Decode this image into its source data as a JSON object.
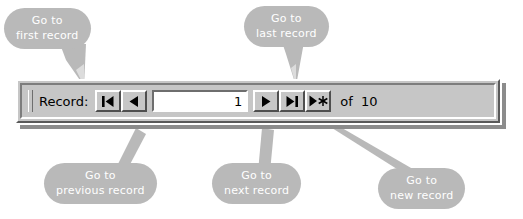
{
  "navbar": {
    "record_label": "Record:",
    "record_value": "1",
    "record_value_placeholder": "",
    "total_label": "of  10",
    "buttons": [
      {
        "name": "first-record",
        "glyph": "first-record-icon"
      },
      {
        "name": "previous-record",
        "glyph": "previous-record-icon"
      },
      {
        "name": "next-record",
        "glyph": "next-record-icon"
      },
      {
        "name": "last-record",
        "glyph": "last-record-icon"
      },
      {
        "name": "new-record",
        "glyph": "new-record-icon"
      }
    ]
  },
  "callouts": {
    "first": {
      "line1": "Go to",
      "line2": "first record"
    },
    "last": {
      "line1": "Go to",
      "line2": "last record"
    },
    "previous": {
      "line1": "Go to",
      "line2": "previous record"
    },
    "next": {
      "line1": "Go to",
      "line2": "next record"
    },
    "new": {
      "line1": "Go to",
      "line2": "new record"
    }
  },
  "colors": {
    "callout_bg": "#b9b9b9",
    "callout_text": "#ffffff",
    "bar_face": "#c6c6c6",
    "bar_shadow": "#8c8c8c",
    "field_bg": "#ffffff",
    "text": "#000000"
  }
}
